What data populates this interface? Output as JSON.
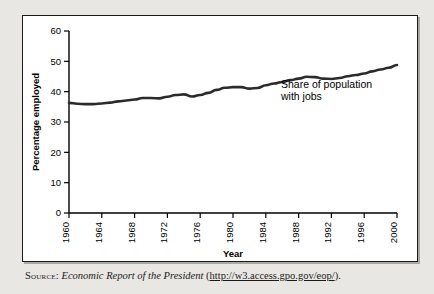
{
  "figure": {
    "panel_background": "#ffffff",
    "page_background": "#e9e7e3",
    "line_color": "#2b2b2b",
    "axis_color": "#000000"
  },
  "annotation": {
    "line1": "Share of population",
    "line2": "with jobs"
  },
  "source": {
    "label": "Source:",
    "title": "Economic Report of the President",
    "open_paren": "(",
    "url": "http://w3.access.gpo.gov/eop/",
    "close_paren": ")."
  },
  "chart_data": {
    "type": "line",
    "title": "",
    "xlabel": "Year",
    "ylabel": "Percentage employed",
    "xlim": [
      1960,
      2000
    ],
    "ylim": [
      0,
      60
    ],
    "grid": false,
    "legend": "none",
    "y_ticks": [
      0,
      10,
      20,
      30,
      40,
      50,
      60
    ],
    "y_tick_labels": [
      "0",
      "10",
      "20",
      "30",
      "40",
      "50",
      "60"
    ],
    "x_ticks": [
      1960,
      1964,
      1968,
      1972,
      1976,
      1980,
      1984,
      1988,
      1992,
      1996,
      2000
    ],
    "x_tick_labels": [
      "1960",
      "1964",
      "1968",
      "1972",
      "1976",
      "1980",
      "1984",
      "1988",
      "1992",
      "1996",
      "2000"
    ],
    "x_tick_rotation": -90,
    "series": [
      {
        "name": "Share of population with jobs",
        "x": [
          1960,
          1961,
          1962,
          1963,
          1964,
          1965,
          1966,
          1967,
          1968,
          1969,
          1970,
          1971,
          1972,
          1973,
          1974,
          1975,
          1976,
          1977,
          1978,
          1979,
          1980,
          1981,
          1982,
          1983,
          1984,
          1985,
          1986,
          1987,
          1988,
          1989,
          1990,
          1991,
          1992,
          1993,
          1994,
          1995,
          1996,
          1997,
          1998,
          1999,
          2000
        ],
        "values": [
          36.3,
          36.0,
          35.9,
          35.9,
          36.1,
          36.4,
          36.8,
          37.1,
          37.4,
          37.9,
          37.9,
          37.8,
          38.3,
          38.9,
          39.1,
          38.4,
          38.9,
          39.6,
          40.6,
          41.3,
          41.5,
          41.5,
          41.0,
          41.2,
          42.1,
          42.7,
          43.2,
          43.8,
          44.3,
          44.9,
          44.8,
          44.3,
          44.2,
          44.5,
          45.1,
          45.5,
          46.0,
          46.7,
          47.3,
          47.9,
          48.8
        ]
      }
    ]
  }
}
